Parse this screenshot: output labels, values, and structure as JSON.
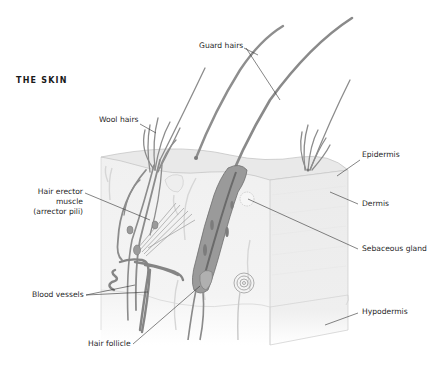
{
  "title": "THE SKIN",
  "labels": {
    "guard_hairs": "Guard hairs",
    "wool_hairs": "Wool hairs",
    "hair_erector_1": "Hair erector",
    "hair_erector_2": "muscle",
    "hair_erector_3": "(arrector pili)",
    "blood_vessels": "Blood vessels",
    "hair_follicle": "Hair follicle",
    "epidermis": "Epidermis",
    "dermis": "Dermis",
    "sebaceous_gland": "Sebaceous gland",
    "hypodermis": "Hypodermis"
  },
  "colors": {
    "structure": "#8a8a8a",
    "structure_dark": "#6e6e6e",
    "skin_fill": "#f1f1f1",
    "side_fill": "#ececec",
    "leader": "#333333"
  }
}
